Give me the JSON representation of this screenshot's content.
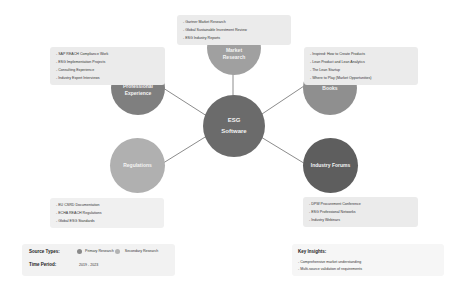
{
  "center": {
    "line1": "ESG",
    "line2": "Software",
    "color": "#6b6b6b"
  },
  "nodes": {
    "market_research": {
      "line1": "Market",
      "line2": "Research",
      "color": "#a0a0a0",
      "items": [
        "Gartner Market Research",
        "Global Sustainable Investment Review",
        "ESG Industry Reports"
      ]
    },
    "professional_experience": {
      "line1": "Professional",
      "line2": "Experience",
      "color": "#7f7f7f",
      "items": [
        "SAP REACH Compliance Work",
        "ESG Implementation Projects",
        "Consulting Experience",
        "Industry Expert Interviews"
      ]
    },
    "books": {
      "label": "Books",
      "color": "#8f8f8f",
      "items": [
        "Inspired: How to Create Products",
        "Lean Product and Lean Analytics",
        "The Lean Startup",
        "Where to Play (Market Opportunities)"
      ]
    },
    "regulations": {
      "label": "Regulations",
      "color": "#b0b0b0",
      "items": [
        "EU CSRD Documentation",
        "ECHA REACH Regulations",
        "Global ESG Standards"
      ]
    },
    "industry_forums": {
      "label": "Industry Forums",
      "color": "#5e5e5e",
      "items": [
        "DPW Procurement Conference",
        "ESG Professional Networks",
        "Industry Webinars"
      ]
    }
  },
  "legend": {
    "source_types_label": "Source Types:",
    "primary_label": "Primary Research",
    "primary_color": "#8a8a8a",
    "secondary_label": "Secondary Research",
    "secondary_color": "#b3b3b3",
    "time_period_label": "Time Period:",
    "time_period_value": "2019 - 2023"
  },
  "insights": {
    "title": "Key Insights:",
    "items": [
      "Comprehensive market understanding",
      "Multi-source validation of requirements"
    ]
  },
  "colors": {
    "connector": "#8c8c8c",
    "infobox_bg": "#ebebeb"
  }
}
